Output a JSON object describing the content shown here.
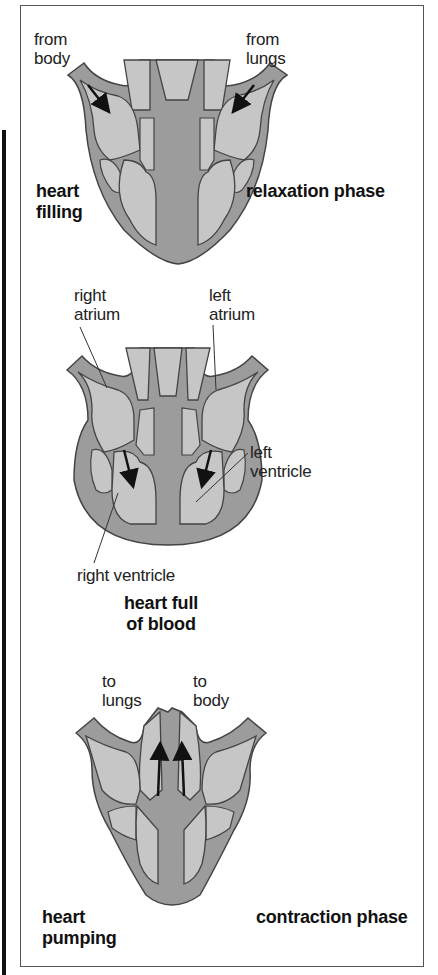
{
  "figure": {
    "colors": {
      "chamber_fill": "#c6c6c6",
      "wall_fill": "#9c9c9c",
      "outline": "#444444",
      "arrow": "#111111",
      "frame": "#555555"
    },
    "stages": [
      {
        "id": "relaxation",
        "labels": {
          "inflow_left_line1": "from",
          "inflow_left_line2": "body",
          "inflow_right_line1": "from",
          "inflow_right_line2": "lungs",
          "state_line1": "heart",
          "state_line2": "filling",
          "phase": "relaxation phase"
        }
      },
      {
        "id": "full",
        "labels": {
          "right_atrium_line1": "right",
          "right_atrium_line2": "atrium",
          "left_atrium_line1": "left",
          "left_atrium_line2": "atrium",
          "left_ventricle_line1": "left",
          "left_ventricle_line2": "ventricle",
          "right_ventricle": "right ventricle",
          "state_line1": "heart full",
          "state_line2": "of blood"
        }
      },
      {
        "id": "contraction",
        "labels": {
          "outflow_left_line1": "to",
          "outflow_left_line2": "lungs",
          "outflow_right_line1": "to",
          "outflow_right_line2": "body",
          "state_line1": "heart",
          "state_line2": "pumping",
          "phase": "contraction phase"
        }
      }
    ]
  }
}
